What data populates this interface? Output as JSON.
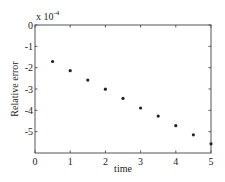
{
  "chart_data": {
    "type": "scatter",
    "title": "",
    "xlabel": "time",
    "ylabel": "Relative error",
    "y_exponent_label": "x 10",
    "y_exponent_power": "-4",
    "xlim": [
      0,
      5
    ],
    "ylim": [
      -6,
      0
    ],
    "xticks": [
      0,
      1,
      2,
      3,
      4,
      5
    ],
    "yticks": [
      0,
      -1,
      -2,
      -3,
      -4,
      -5
    ],
    "xtick_labels": [
      "0",
      "1",
      "2",
      "3",
      "4",
      "5"
    ],
    "ytick_labels": [
      "0",
      "-1",
      "-2",
      "-3",
      "-4",
      "-5"
    ],
    "grid": false,
    "legend": null,
    "series": [
      {
        "name": "Relative error",
        "marker": "dot",
        "color": "#222222",
        "x": [
          0.5,
          1.0,
          1.5,
          2.0,
          2.5,
          3.0,
          3.5,
          4.0,
          4.5,
          5.0
        ],
        "y": [
          -1.71,
          -2.14,
          -2.58,
          -3.01,
          -3.44,
          -3.89,
          -4.27,
          -4.72,
          -5.15,
          -5.57
        ]
      }
    ]
  },
  "colors": {
    "axis": "#555555",
    "marker": "#222222",
    "text": "#222222",
    "background": "#ffffff"
  }
}
